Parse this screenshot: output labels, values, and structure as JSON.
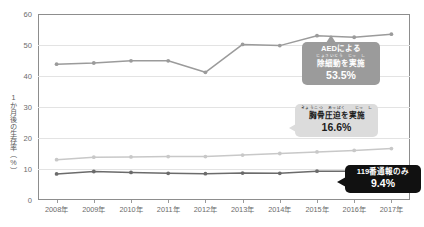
{
  "chart_data": {
    "type": "line",
    "title": "",
    "xlabel": "",
    "ylabel": "1か月後の生存率（%）",
    "ylim": [
      0,
      60
    ],
    "ytick_step": 10,
    "grid": true,
    "legend_position": "none",
    "categories": [
      "2008年",
      "2009年",
      "2010年",
      "2011年",
      "2012年",
      "2013年",
      "2014年",
      "2015年",
      "2016年",
      "2017年"
    ],
    "yticks": [
      "0",
      "10",
      "20",
      "30",
      "40",
      "50",
      "60"
    ],
    "series": [
      {
        "name": "AEDによる除細動を実施",
        "color": "#9b9b9b",
        "values": [
          43.8,
          44.2,
          44.9,
          44.9,
          41.2,
          50.2,
          49.8,
          53.0,
          52.5,
          53.5
        ]
      },
      {
        "name": "胸骨圧迫を実施",
        "color": "#c8c8c8",
        "values": [
          13.0,
          13.8,
          13.9,
          14.0,
          14.0,
          14.5,
          15.0,
          15.5,
          16.0,
          16.6
        ]
      },
      {
        "name": "119番通報のみ",
        "color": "#6b6b6b",
        "values": [
          8.4,
          9.2,
          8.9,
          8.6,
          8.5,
          8.7,
          8.6,
          9.3,
          9.3,
          9.4
        ]
      }
    ]
  },
  "callouts": {
    "aed": {
      "line1": "AEDによる",
      "line2": "除細動を実施",
      "furigana1": "",
      "furigana2": "じょさいどう　じっ　し",
      "value": "53.5%",
      "color": "#9b9b9b"
    },
    "chest": {
      "line1": "胸骨圧迫を実施",
      "furigana1": "きょうこつ　あっぱく　　じっ　し",
      "value": "16.6%",
      "color": "#dcdcdc"
    },
    "call": {
      "line1": "119番通報のみ",
      "value": "9.4%",
      "color": "#111111"
    }
  }
}
